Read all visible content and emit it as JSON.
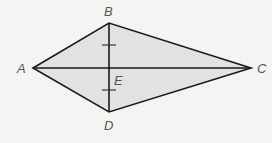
{
  "diagram": {
    "shape": "kite",
    "colors": {
      "background": "#f4f4f2",
      "fill": "#e2e2e0",
      "stroke": "#1a1a1a",
      "label": "#555555"
    },
    "vertices": {
      "A": {
        "label": "A",
        "x": 33,
        "y": 68
      },
      "B": {
        "label": "B",
        "x": 109,
        "y": 23
      },
      "C": {
        "label": "C",
        "x": 251,
        "y": 68
      },
      "D": {
        "label": "D",
        "x": 109,
        "y": 112
      }
    },
    "intersection": {
      "label": "E",
      "x": 109,
      "y": 68
    },
    "diagonals": [
      "AC",
      "BD"
    ],
    "congruence_marks": [
      {
        "segment": "BE",
        "x": 109,
        "y": 45,
        "count": 1
      },
      {
        "segment": "ED",
        "x": 109,
        "y": 90,
        "count": 1
      }
    ]
  }
}
